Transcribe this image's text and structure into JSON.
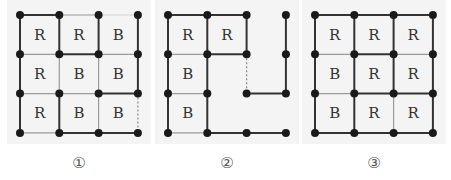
{
  "figures": [
    {
      "label": "①",
      "origin": [
        20,
        15
      ],
      "cells": [
        [
          "R",
          "R",
          "B"
        ],
        [
          "R",
          "B",
          "B"
        ],
        [
          "R",
          "B",
          "B"
        ]
      ],
      "hide_cells": [],
      "nodes_missing": [],
      "h_edges": [
        [
          "t",
          "n",
          "l"
        ],
        [
          "n",
          "t",
          "n"
        ],
        [
          "n",
          "n",
          "t"
        ],
        [
          "n",
          "t",
          "t"
        ]
      ],
      "v_edges": [
        [
          "t",
          "t",
          "t",
          "t"
        ],
        [
          "t",
          "n",
          "n",
          "t"
        ],
        [
          "t",
          "t",
          "n",
          "d"
        ]
      ]
    },
    {
      "label": "②",
      "origin": [
        168,
        15
      ],
      "cells": [
        [
          "R",
          "R",
          ""
        ],
        [
          "B",
          "",
          ""
        ],
        [
          "B",
          "",
          ""
        ]
      ],
      "nodes_missing": [],
      "h_edges": [
        [
          "t",
          "t",
          ""
        ],
        [
          "n",
          "t",
          ""
        ],
        [
          "n",
          "",
          "t"
        ],
        [
          "n",
          "t",
          "t"
        ]
      ],
      "v_edges": [
        [
          "t",
          "t",
          "t",
          "t"
        ],
        [
          "t",
          "t",
          "d",
          "t"
        ],
        [
          "t",
          "t",
          "",
          ""
        ]
      ]
    },
    {
      "label": "③",
      "origin": [
        315,
        15
      ],
      "cells": [
        [
          "R",
          "R",
          "R"
        ],
        [
          "B",
          "R",
          "R"
        ],
        [
          "B",
          "R",
          "R"
        ]
      ],
      "nodes_missing": [],
      "h_edges": [
        [
          "t",
          "t",
          "t"
        ],
        [
          "n",
          "t",
          "n"
        ],
        [
          "n",
          "t",
          "t"
        ],
        [
          "t",
          "t",
          "t"
        ]
      ],
      "v_edges": [
        [
          "t",
          "t",
          "t",
          "t"
        ],
        [
          "t",
          "t",
          "t",
          "t"
        ],
        [
          "t",
          "t",
          "n",
          "t"
        ]
      ]
    }
  ],
  "colors": {
    "thick": "#333333",
    "thin": "#9a9a9a",
    "light": "#cfcfcf",
    "dashed": "#888888",
    "node": "#1a1a1a",
    "panel": "#f4f4f4"
  }
}
